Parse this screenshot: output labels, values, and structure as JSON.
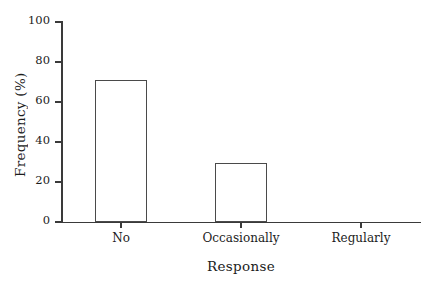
{
  "chart_data": {
    "type": "bar",
    "title": "",
    "subtitle": "",
    "xlabel": "Response",
    "ylabel": "Frequency (%)",
    "categories": [
      "No",
      "Occasionally",
      "Regularly"
    ],
    "values": [
      71,
      29.5,
      0
    ],
    "ylim": [
      0,
      100
    ],
    "yticks": [
      0,
      20,
      40,
      60,
      80,
      100
    ],
    "ytick_labels": [
      "0",
      "20",
      "40",
      "60",
      "80",
      "100"
    ],
    "grid": false,
    "legend": null,
    "legend_position": "none",
    "bar_face_color": "#ffffff",
    "bar_edge_color": "#4a4a4a",
    "axis_color": "#3a3a3a",
    "background_color": "#ffffff"
  },
  "figure": {
    "axis_title_x": "Response",
    "axis_title_y": "Frequency (%)"
  }
}
